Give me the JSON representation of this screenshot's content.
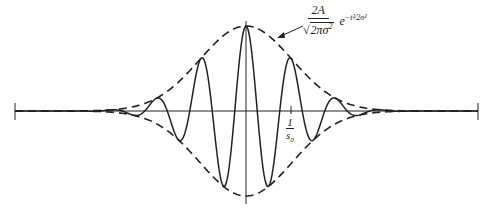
{
  "figure": {
    "type": "gaussian-modulated-cosine",
    "envelope_formula": {
      "numerator": "2A",
      "denominator_radical": "2πσ",
      "denominator_power": "2",
      "exponential": "e",
      "exponent": "−t²/2σ²",
      "exponent_display": "−t²⁄2σ²"
    },
    "tick_label": {
      "numerator": "1",
      "denominator": "s",
      "denominator_sub": "0"
    },
    "colors": {
      "ink": "#222222",
      "background": "#ffffff"
    }
  }
}
